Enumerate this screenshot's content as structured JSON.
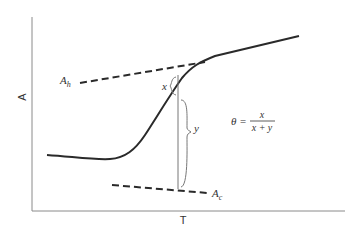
{
  "diagram": {
    "type": "sigmoid absorbance-temperature curve with baselines",
    "x_axis_label": "T",
    "y_axis_label": "A",
    "upper_baseline_label": "A",
    "upper_baseline_subscript": "h",
    "lower_baseline_label": "A",
    "lower_baseline_subscript": "c",
    "segment_x_label": "x",
    "segment_y_label": "y",
    "equation_lhs": "θ =",
    "equation_numerator": "x",
    "equation_denominator": "x + y"
  },
  "colors": {
    "curve": "#2a2a2a",
    "axis": "#888888",
    "dashed": "#2a2a2a",
    "marker": "#777777"
  }
}
